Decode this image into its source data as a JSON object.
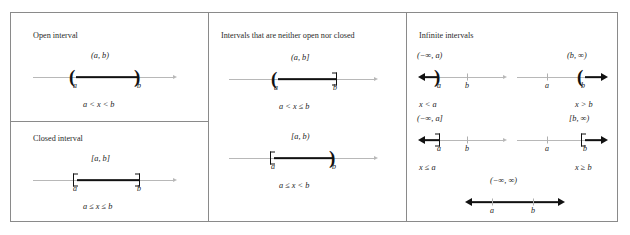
{
  "figure": {
    "columns": [
      {
        "heading": "Open interval",
        "panels": [
          {
            "notation": "(a, b)",
            "left_mark": "(",
            "right_mark": ")",
            "left_label": "a",
            "right_label": "b",
            "inequality": "a < x < b"
          }
        ]
      },
      {
        "heading": "Intervals that are neither open nor closed",
        "panels": [
          {
            "notation": "(a, b]",
            "left_mark": "(",
            "right_mark": "]",
            "left_label": "a",
            "right_label": "b",
            "inequality": "a < x ≤ b"
          },
          {
            "notation": "[a, b)",
            "left_mark": "[",
            "right_mark": ")",
            "left_label": "a",
            "right_label": "b",
            "inequality": "a ≤ x < b"
          }
        ]
      },
      {
        "heading": "Infinite intervals",
        "panels": [
          {
            "notation": "(−∞, a)",
            "left_label": "a",
            "right_label": "b",
            "inequality": "x < a"
          },
          {
            "notation": "(b, ∞)",
            "left_label": "a",
            "right_label": "b",
            "inequality": "x > b"
          },
          {
            "notation": "(−∞, a]",
            "left_label": "a",
            "right_label": "b",
            "inequality": "x ≤ a"
          },
          {
            "notation": "[b, ∞)",
            "left_label": "a",
            "right_label": "b",
            "inequality": "x ≥ b"
          },
          {
            "notation": "(−∞, ∞)",
            "left_label": "a",
            "right_label": "b",
            "inequality": ""
          }
        ]
      }
    ]
  },
  "closed": {
    "heading": "Closed interval"
  }
}
